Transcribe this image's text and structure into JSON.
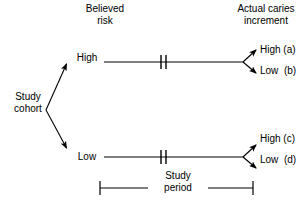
{
  "figure": {
    "type": "flow-diagram",
    "background_color": "#ffffff",
    "line_color": "#000000",
    "headers": {
      "believed_risk": "Believed\nrisk",
      "actual_caries": "Actual caries\nincrement"
    },
    "root": {
      "label": "Study\ncohort"
    },
    "branches": [
      {
        "risk_label": "High",
        "outcomes": [
          {
            "label": "High (a)",
            "code": "a"
          },
          {
            "label": "Low  (b)",
            "code": "b"
          }
        ]
      },
      {
        "risk_label": "Low",
        "outcomes": [
          {
            "label": "High (c)",
            "code": "c"
          },
          {
            "label": "Low  (d)",
            "code": "d"
          }
        ]
      }
    ],
    "study_period": {
      "label": "Study\nperiod"
    }
  }
}
